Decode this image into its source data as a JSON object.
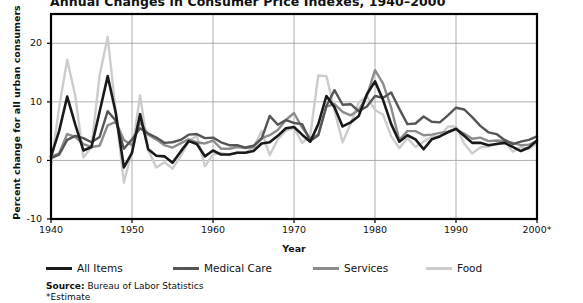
{
  "chart_data": {
    "type": "line",
    "title": "Annual Changes in Consumer Price Indexes, 1940–2000",
    "xlabel": "Year",
    "ylabel": "Percent change for all urban consumers",
    "xlim": [
      1940,
      2000
    ],
    "ylim": [
      -10,
      25
    ],
    "ytick_labels": [
      "20",
      "10",
      "0",
      "-10"
    ],
    "ytick_values": [
      20,
      10,
      0,
      -10
    ],
    "xtick_labels": [
      "1940",
      "1950",
      "1960",
      "1970",
      "1980",
      "1990",
      "2000*"
    ],
    "xtick_values": [
      1940,
      1950,
      1960,
      1970,
      1980,
      1990,
      2000
    ],
    "grid": true,
    "legend_position": "below-axes",
    "x": [
      1940,
      1941,
      1942,
      1943,
      1944,
      1945,
      1946,
      1947,
      1948,
      1949,
      1950,
      1951,
      1952,
      1953,
      1954,
      1955,
      1956,
      1957,
      1958,
      1959,
      1960,
      1961,
      1962,
      1963,
      1964,
      1965,
      1966,
      1967,
      1968,
      1969,
      1970,
      1971,
      1972,
      1973,
      1974,
      1975,
      1976,
      1977,
      1978,
      1979,
      1980,
      1981,
      1982,
      1983,
      1984,
      1985,
      1986,
      1987,
      1988,
      1989,
      1990,
      1991,
      1992,
      1993,
      1994,
      1995,
      1996,
      1997,
      1998,
      1999,
      2000
    ],
    "series": [
      {
        "name": "All Items",
        "color": "#1a1a1a",
        "width": 2.6,
        "values": [
          0.7,
          5.0,
          10.9,
          6.1,
          1.7,
          2.3,
          8.3,
          14.4,
          8.1,
          -1.2,
          1.3,
          7.9,
          1.9,
          0.8,
          0.7,
          -0.4,
          1.5,
          3.3,
          2.8,
          0.7,
          1.7,
          1.0,
          1.0,
          1.3,
          1.3,
          1.6,
          2.9,
          3.1,
          4.2,
          5.5,
          5.7,
          4.4,
          3.2,
          6.2,
          11.0,
          9.1,
          5.8,
          6.5,
          7.6,
          11.3,
          13.5,
          10.3,
          6.2,
          3.2,
          4.3,
          3.6,
          1.9,
          3.6,
          4.1,
          4.8,
          5.4,
          4.2,
          3.0,
          3.0,
          2.6,
          2.8,
          3.0,
          2.3,
          1.6,
          2.2,
          3.4
        ]
      },
      {
        "name": "Medical Care",
        "color": "#555555",
        "width": 2.4,
        "values": [
          0.4,
          1.0,
          3.5,
          4.2,
          3.8,
          3.1,
          4.0,
          8.4,
          6.8,
          2.0,
          3.6,
          5.5,
          4.6,
          3.9,
          3.0,
          3.1,
          3.5,
          4.4,
          4.5,
          3.8,
          3.9,
          3.1,
          2.6,
          2.6,
          2.2,
          2.5,
          3.7,
          7.6,
          6.1,
          6.9,
          6.4,
          6.2,
          3.3,
          4.3,
          9.3,
          12.0,
          9.5,
          9.6,
          8.4,
          9.2,
          11.0,
          10.7,
          11.6,
          8.8,
          6.2,
          6.3,
          7.5,
          6.6,
          6.5,
          7.7,
          9.0,
          8.7,
          7.4,
          5.9,
          4.8,
          4.5,
          3.5,
          2.8,
          3.2,
          3.5,
          4.1
        ]
      },
      {
        "name": "Services",
        "color": "#8c8c8c",
        "width": 2.4,
        "values": [
          0.6,
          1.2,
          4.5,
          4.0,
          2.8,
          2.3,
          2.5,
          6.0,
          6.6,
          3.5,
          2.6,
          6.5,
          4.4,
          3.6,
          2.6,
          2.2,
          2.9,
          3.6,
          3.1,
          2.9,
          3.4,
          2.0,
          2.0,
          2.3,
          2.1,
          2.3,
          3.8,
          4.3,
          5.2,
          6.9,
          8.1,
          5.6,
          3.8,
          4.4,
          9.2,
          9.6,
          8.3,
          7.7,
          8.6,
          11.0,
          15.4,
          13.1,
          9.0,
          3.5,
          5.0,
          5.0,
          4.3,
          4.4,
          4.7,
          4.9,
          5.3,
          4.6,
          3.7,
          3.9,
          3.3,
          3.4,
          3.3,
          3.0,
          2.6,
          2.7,
          3.3
        ]
      },
      {
        "name": "Food",
        "color": "#cccccc",
        "width": 2.4,
        "values": [
          -1.0,
          9.0,
          17.2,
          11.0,
          0.5,
          2.3,
          14.5,
          21.1,
          8.2,
          -3.8,
          1.6,
          11.1,
          1.8,
          -1.2,
          -0.3,
          -1.4,
          0.7,
          3.3,
          4.2,
          -1.0,
          1.0,
          1.3,
          0.9,
          1.4,
          1.3,
          2.2,
          5.0,
          0.9,
          3.6,
          5.1,
          5.5,
          3.0,
          4.2,
          14.5,
          14.4,
          8.5,
          3.1,
          6.3,
          9.9,
          11.0,
          8.6,
          7.8,
          4.1,
          2.1,
          3.8,
          2.3,
          3.2,
          4.1,
          4.1,
          5.8,
          5.8,
          2.9,
          1.2,
          2.2,
          2.4,
          2.8,
          3.3,
          1.5,
          2.3,
          2.0,
          2.9
        ]
      }
    ]
  },
  "axis": {
    "ytick_labels": [
      "20",
      "10",
      "0",
      "-10"
    ],
    "xtick_labels": [
      "1940",
      "1950",
      "1960",
      "1970",
      "1980",
      "1990",
      "2000*"
    ],
    "xlabel": "Year",
    "ylabel": "Percent change for all urban consumers"
  },
  "legend": {
    "items": [
      {
        "label": "All Items",
        "color": "#1a1a1a"
      },
      {
        "label": "Medical Care",
        "color": "#555555"
      },
      {
        "label": "Services",
        "color": "#8c8c8c"
      },
      {
        "label": "Food",
        "color": "#cccccc"
      }
    ]
  },
  "footnotes": {
    "source_label": "Source:",
    "source_text": " Bureau of Labor Statistics",
    "estimate_note": "*Estimate"
  }
}
